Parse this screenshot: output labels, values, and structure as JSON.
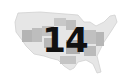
{
  "map": {
    "region": "United States",
    "label": "14",
    "colors": {
      "outline": "#d0d0d0",
      "light_state": "#e4e4e4",
      "mid_state": "#bcbcbc",
      "dark_state": "#a8a8a8",
      "label": "#111111"
    }
  }
}
